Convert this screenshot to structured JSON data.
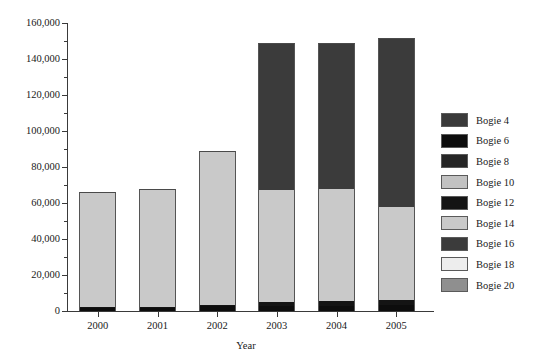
{
  "chart_data": {
    "type": "bar",
    "stacked": true,
    "title": "",
    "xlabel": "Year",
    "ylabel": "",
    "categories": [
      "2000",
      "2001",
      "2002",
      "2003",
      "2004",
      "2005"
    ],
    "ylim": [
      0,
      160000
    ],
    "ytick_step": 20000,
    "yminor_step": 10000,
    "ytick_labels": [
      "0",
      "20,000",
      "40,000",
      "60,000",
      "80,000",
      "100,000",
      "120,000",
      "140,000",
      "160,000"
    ],
    "ytick_values": [
      0,
      20000,
      40000,
      60000,
      80000,
      100000,
      120000,
      140000,
      160000
    ],
    "grid": false,
    "legend_position": "right",
    "totals": [
      66000,
      68000,
      88800,
      149000,
      149000,
      151500
    ],
    "series": [
      {
        "name": "Bogie 4",
        "color": "#3a3a3a",
        "values": [
          0,
          0,
          0,
          0,
          0,
          0
        ]
      },
      {
        "name": "Bogie 6",
        "color": "#0d0d0d",
        "values": [
          1800,
          2100,
          2600,
          2700,
          3000,
          3100
        ]
      },
      {
        "name": "Bogie 8",
        "color": "#262626",
        "values": [
          0,
          0,
          0,
          0,
          0,
          0
        ]
      },
      {
        "name": "Bogie 10",
        "color": "#c2c2c2",
        "values": [
          0,
          0,
          0,
          0,
          0,
          0
        ]
      },
      {
        "name": "Bogie 12",
        "color": "#141414",
        "values": [
          300,
          400,
          900,
          2300,
          2600,
          2900
        ]
      },
      {
        "name": "Bogie 14",
        "color": "#c9c9c9",
        "values": [
          63900,
          65500,
          85300,
          62000,
          62400,
          52000
        ]
      },
      {
        "name": "Bogie 16",
        "color": "#3b3b3b",
        "values": [
          0,
          0,
          0,
          82000,
          81000,
          93500
        ]
      },
      {
        "name": "Bogie 18",
        "color": "#ededed",
        "values": [
          0,
          0,
          0,
          0,
          0,
          0
        ]
      },
      {
        "name": "Bogie 20",
        "color": "#8f8f8f",
        "values": [
          0,
          0,
          0,
          0,
          0,
          0
        ]
      }
    ]
  },
  "legend": {
    "items": [
      {
        "label": "Bogie 4",
        "color": "#3a3a3a"
      },
      {
        "label": "Bogie 6",
        "color": "#0d0d0d"
      },
      {
        "label": "Bogie 8",
        "color": "#262626"
      },
      {
        "label": "Bogie 10",
        "color": "#c2c2c2"
      },
      {
        "label": "Bogie 12",
        "color": "#141414"
      },
      {
        "label": "Bogie 14",
        "color": "#c9c9c9"
      },
      {
        "label": "Bogie 16",
        "color": "#3b3b3b"
      },
      {
        "label": "Bogie 18",
        "color": "#ededed"
      },
      {
        "label": "Bogie 20",
        "color": "#8f8f8f"
      }
    ]
  },
  "axis": {
    "x_title": "Year",
    "axis_color": "#3a3a3a"
  }
}
